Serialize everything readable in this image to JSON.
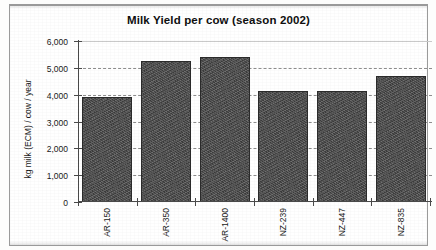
{
  "chart_data": {
    "type": "bar",
    "title": "Milk Yield per cow (season 2002)",
    "xlabel": "",
    "ylabel": "kg milk (ECM) / cow / year",
    "categories": [
      "AR-150",
      "AR-350",
      "AR-1400",
      "NZ-239",
      "NZ-447",
      "NZ-835"
    ],
    "values": [
      3900,
      5250,
      5400,
      4150,
      4150,
      4700
    ],
    "series": [
      {
        "name": "Milk yield",
        "values": [
          3900,
          5250,
          5400,
          4150,
          4150,
          4700
        ]
      }
    ],
    "ylim": [
      0,
      6000
    ],
    "ytick_values": [
      0,
      1000,
      2000,
      3000,
      4000,
      5000,
      6000
    ],
    "ytick_labels": [
      "0",
      "1,000",
      "2,000",
      "3,000",
      "4,000",
      "5,000",
      "6,000"
    ],
    "grid": true,
    "grid_style": "dashed",
    "legend": null,
    "bar_color": "#4c4c4c",
    "bar_edge_color": "#2b2b2b",
    "axis_color": "#4a4a4a",
    "gridline_color": "#8d8d8d",
    "background_color": "#ffffff",
    "xlabel_rotation": 90
  }
}
